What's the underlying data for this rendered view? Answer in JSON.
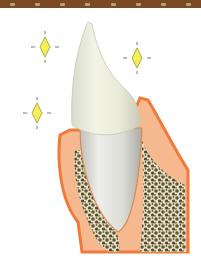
{
  "header": {
    "strip_color": "#7a4a22",
    "dots": 8
  },
  "illustration": {
    "subject": "tooth-with-sparkles",
    "description": "Clean white canine tooth set in pink gum and spongy alveolar bone, surrounded by yellow sparkles",
    "colors": {
      "background": "#ffffff",
      "tooth_crown": "#eef0e0",
      "tooth_root": "#dedfd9",
      "gum": "#f6b98f",
      "gum_edge": "#ef7a3a",
      "bone": "#6b6342",
      "sparkle": "#f5ee55",
      "sparkle_outline": "#9a9440"
    },
    "sparkles": [
      {
        "name": "sparkle-top-left",
        "cx": 45,
        "cy": 47
      },
      {
        "name": "sparkle-top-right",
        "cx": 137,
        "cy": 58
      },
      {
        "name": "sparkle-bottom-left",
        "cx": 37,
        "cy": 113
      }
    ]
  }
}
